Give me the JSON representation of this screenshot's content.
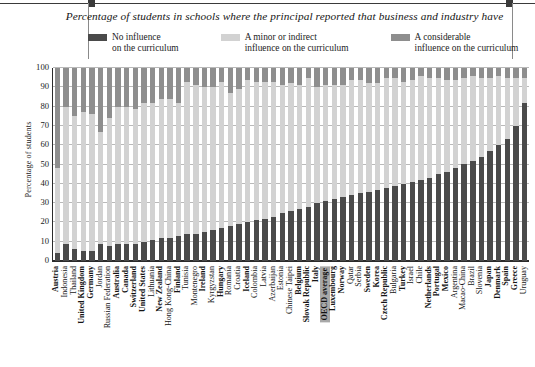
{
  "figure": {
    "title": "Percentage of students in schools where the principal reported that business and industry have",
    "ylabel": "Percentage of students"
  },
  "legend": {
    "items": [
      {
        "label_line1": "No influence",
        "label_line2": "on the curriculum",
        "color": "#4a4a4a",
        "key": "no_influence"
      },
      {
        "label_line1": "A minor or indirect",
        "label_line2": "influence on the curriculum",
        "color": "#d2d2d2",
        "key": "minor"
      },
      {
        "label_line1": "A considerable",
        "label_line2": "influence on the curriculum",
        "color": "#8e8e8e",
        "key": "considerable"
      }
    ]
  },
  "colors": {
    "no_influence": "#4a4a4a",
    "minor": "#d2d2d2",
    "considerable": "#8e8e8e",
    "highlight": "#a8a8a8",
    "grid": "#b9b9b9",
    "axis": "#2b2b2b"
  },
  "chart_data": {
    "type": "bar",
    "subtype": "stacked-100",
    "title": "Percentage of students in schools where the principal reported that business and industry have",
    "xlabel": "",
    "ylabel": "Percentage of students",
    "ylim": [
      0,
      100
    ],
    "yticks": [
      0,
      10,
      20,
      30,
      40,
      50,
      60,
      70,
      80,
      90,
      100
    ],
    "grid": true,
    "legend_position": "top",
    "categories": [
      "Austria",
      "Indonesia",
      "Thailand",
      "United Kingdom",
      "Germany",
      "Jordan",
      "Russian Federation",
      "Australia",
      "Canada",
      "Switzerland",
      "United States",
      "Lithuania",
      "New Zealand",
      "Hong Kong-China",
      "Finland",
      "Tunisia",
      "Montenegro",
      "Ireland",
      "Kyrgyzstan",
      "Hungary",
      "Romania",
      "Croatia",
      "Iceland",
      "Colombia",
      "Latvia",
      "Azerbaijan",
      "Estonia",
      "Chinese Taipei",
      "Belgium",
      "Slovak Republic",
      "Italy",
      "OECD average",
      "Luxembourg",
      "Norway",
      "Qatar",
      "Serbia",
      "Sweden",
      "Korea",
      "Czech Republic",
      "Bulgaria",
      "Turkey",
      "Israel",
      "Chile",
      "Netherlands",
      "Portugal",
      "Mexico",
      "Argentina",
      "Macao-China",
      "Brazil",
      "Slovenia",
      "Japan",
      "Denmark",
      "Spain",
      "Greece",
      "Uruguay"
    ],
    "bold_categories": [
      "Austria",
      "United Kingdom",
      "Germany",
      "Australia",
      "Canada",
      "Switzerland",
      "United States",
      "New Zealand",
      "Finland",
      "Ireland",
      "Hungary",
      "Iceland",
      "Belgium",
      "Slovak Republic",
      "Italy",
      "OECD average",
      "Luxembourg",
      "Norway",
      "Sweden",
      "Korea",
      "Czech Republic",
      "Turkey",
      "Netherlands",
      "Portugal",
      "Mexico",
      "Japan",
      "Denmark",
      "Spain",
      "Greece"
    ],
    "highlight_category": "OECD average",
    "series": [
      {
        "name": "No influence on the curriculum",
        "key": "no_influence",
        "color": "#4a4a4a",
        "values": [
          4,
          9,
          6,
          5,
          5,
          9,
          8,
          9,
          9,
          9,
          10,
          11,
          12,
          12,
          13,
          14,
          14,
          15,
          16,
          17,
          18,
          19,
          20,
          21,
          22,
          23,
          25,
          26,
          27,
          28,
          30,
          31,
          32,
          33,
          34,
          35,
          36,
          37,
          38,
          39,
          40,
          41,
          42,
          43,
          45,
          46,
          48,
          50,
          52,
          54,
          57,
          60,
          63,
          70,
          82
        ]
      },
      {
        "name": "A minor or indirect influence on the curriculum",
        "key": "minor",
        "color": "#d2d2d2",
        "values": [
          44,
          71,
          69,
          72,
          71,
          58,
          66,
          71,
          71,
          70,
          72,
          71,
          72,
          72,
          69,
          79,
          77,
          75,
          74,
          76,
          69,
          70,
          74,
          72,
          71,
          70,
          66,
          66,
          64,
          67,
          60,
          60,
          59,
          58,
          60,
          59,
          56,
          55,
          57,
          56,
          53,
          53,
          54,
          52,
          50,
          48,
          46,
          45,
          44,
          41,
          38,
          36,
          32,
          25,
          13
        ]
      },
      {
        "name": "A considerable influence on the curriculum",
        "key": "considerable",
        "color": "#8e8e8e",
        "values": [
          52,
          20,
          25,
          23,
          24,
          33,
          26,
          20,
          20,
          21,
          18,
          18,
          16,
          16,
          18,
          7,
          9,
          10,
          10,
          7,
          13,
          11,
          6,
          7,
          7,
          7,
          9,
          8,
          9,
          5,
          10,
          9,
          9,
          9,
          6,
          6,
          8,
          8,
          5,
          5,
          7,
          6,
          4,
          5,
          5,
          6,
          6,
          5,
          4,
          5,
          5,
          4,
          5,
          5,
          5
        ]
      }
    ]
  }
}
